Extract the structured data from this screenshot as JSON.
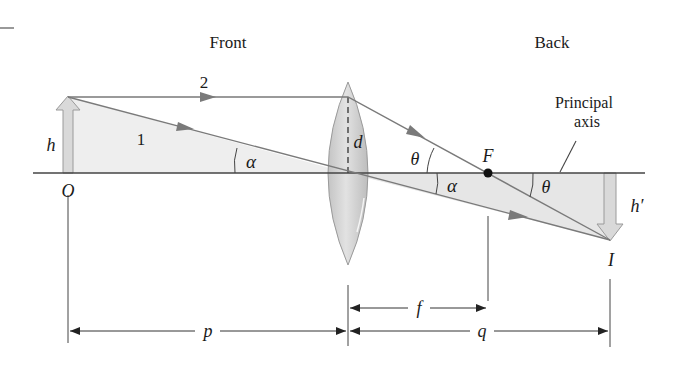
{
  "header": {
    "front_label": "Front",
    "back_label": "Back"
  },
  "labels": {
    "ray1": "1",
    "ray2": "2",
    "object_height": "h",
    "object_point": "O",
    "lens_half_height": "d",
    "angle_alpha_left": "α",
    "angle_alpha_right": "α",
    "angle_theta_left": "θ",
    "angle_theta_right": "θ",
    "focal_point": "F",
    "principal_axis_line1": "Principal",
    "principal_axis_line2": "axis",
    "image_height": "h′",
    "image_point": "I"
  },
  "dimensions": {
    "focal_length": "f",
    "object_distance": "p",
    "image_distance": "q"
  },
  "colors": {
    "line": "#444444",
    "ray": "#7a7a7a",
    "shade": "#ececec",
    "lens_fill": "#d4d4d4",
    "arrow_fill": "#d8d8d8",
    "arrow_stroke": "#9a9a9a",
    "text": "#1a1a1a"
  }
}
